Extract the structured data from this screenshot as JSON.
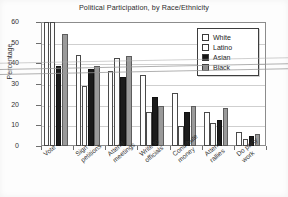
{
  "chart_data": {
    "type": "bar",
    "title": "Political Participation, by Race/Ethnicity",
    "xlabel": "",
    "ylabel": "Percentage",
    "ylim": [
      0,
      60
    ],
    "yticks": [
      0,
      10,
      20,
      30,
      40,
      50,
      60
    ],
    "grid": true,
    "legend_position": "top-right",
    "categories": [
      "Vote",
      "Sign\npetitions",
      "Attend\nmeetings",
      "Write to\nofficials",
      "Contribute\nmoney",
      "Attend\nrallies",
      "Do party\nwork"
    ],
    "series": [
      {
        "name": "White",
        "color": "#fefefe",
        "values": [
          62,
          44,
          36.5,
          34.5,
          25.5,
          16.5,
          7.0
        ]
      },
      {
        "name": "Latino",
        "color": "#fbfbfb",
        "values": [
          62,
          29,
          42.5,
          16.5,
          9.5,
          11.0,
          3.5
        ]
      },
      {
        "name": "Asian",
        "color": "#1b1b1b",
        "values": [
          38.5,
          37.5,
          33.5,
          23.5,
          16.5,
          12.5,
          5.0
        ]
      },
      {
        "name": "Black",
        "color": "#9a9a9a",
        "values": [
          54,
          38.5,
          43.5,
          19.5,
          19.5,
          18.5,
          6.0
        ]
      }
    ]
  },
  "legend": {
    "items": [
      {
        "label": "White"
      },
      {
        "label": "Latino"
      },
      {
        "label": "Asian"
      },
      {
        "label": "Black"
      }
    ]
  }
}
